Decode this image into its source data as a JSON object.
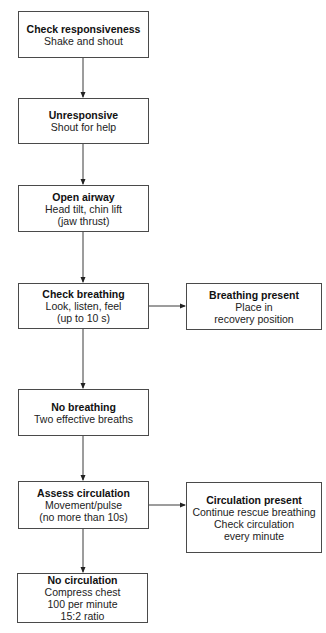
{
  "diagram": {
    "type": "flowchart",
    "colors": {
      "border": "#4a4a4a",
      "line": "#3a3a3a",
      "text": "#1a1a1a",
      "background": "#ffffff"
    },
    "nodes": [
      {
        "id": "check-responsiveness",
        "title": "Check responsiveness",
        "lines": [
          "Shake and shout"
        ]
      },
      {
        "id": "unresponsive",
        "title": "Unresponsive",
        "lines": [
          "Shout for help"
        ]
      },
      {
        "id": "open-airway",
        "title": "Open airway",
        "lines": [
          "Head tilt, chin lift",
          "(jaw thrust)"
        ]
      },
      {
        "id": "check-breathing",
        "title": "Check breathing",
        "lines": [
          "Look, listen, feel",
          "(up to 10 s)"
        ]
      },
      {
        "id": "breathing-present",
        "title": "Breathing present",
        "lines": [
          "Place in",
          "recovery position"
        ]
      },
      {
        "id": "no-breathing",
        "title": "No breathing",
        "lines": [
          "Two effective breaths"
        ]
      },
      {
        "id": "assess-circulation",
        "title": "Assess circulation",
        "lines": [
          "Movement/pulse",
          "(no more than 10s)"
        ]
      },
      {
        "id": "circulation-present",
        "title": "Circulation present",
        "lines": [
          "Continue rescue breathing",
          "Check circulation",
          "every minute"
        ]
      },
      {
        "id": "no-circulation",
        "title": "No circulation",
        "lines": [
          "Compress chest",
          "100 per minute",
          "15:2 ratio"
        ]
      }
    ],
    "edges": [
      {
        "from": "check-responsiveness",
        "to": "unresponsive"
      },
      {
        "from": "unresponsive",
        "to": "open-airway"
      },
      {
        "from": "open-airway",
        "to": "check-breathing"
      },
      {
        "from": "check-breathing",
        "to": "breathing-present"
      },
      {
        "from": "check-breathing",
        "to": "no-breathing"
      },
      {
        "from": "no-breathing",
        "to": "assess-circulation"
      },
      {
        "from": "assess-circulation",
        "to": "circulation-present"
      },
      {
        "from": "assess-circulation",
        "to": "no-circulation"
      }
    ]
  }
}
